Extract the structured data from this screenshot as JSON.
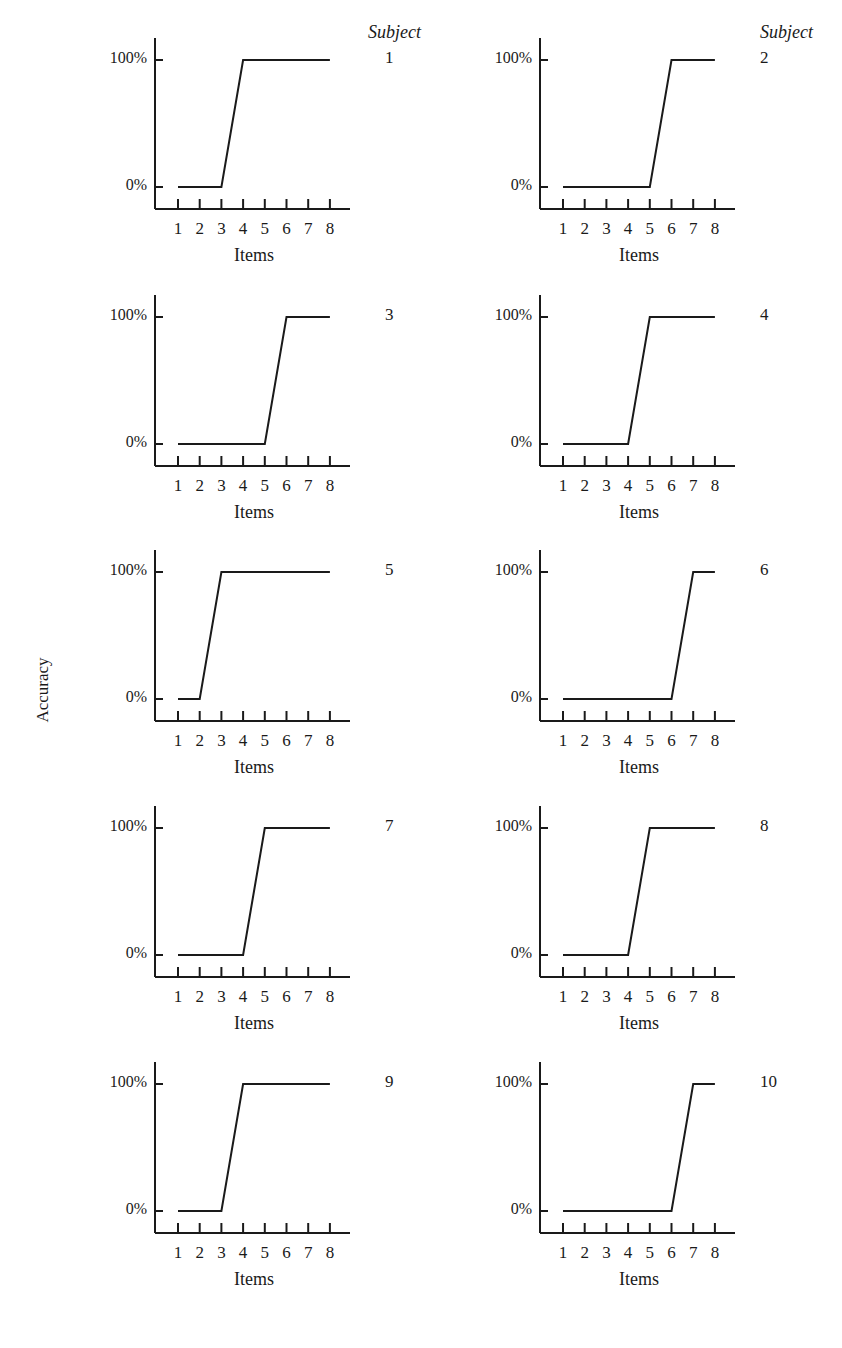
{
  "figure": {
    "y_axis_label": "Accuracy",
    "subject_header": "Subject",
    "x_axis_label": "Items",
    "y_ticks": [
      "0%",
      "100%"
    ],
    "x_ticks": [
      "1",
      "2",
      "3",
      "4",
      "5",
      "6",
      "7",
      "8"
    ]
  },
  "panels": [
    {
      "subject": "1",
      "last_zero_item": 3,
      "first_full_item": 4
    },
    {
      "subject": "2",
      "last_zero_item": 5,
      "first_full_item": 6
    },
    {
      "subject": "3",
      "last_zero_item": 5,
      "first_full_item": 6
    },
    {
      "subject": "4",
      "last_zero_item": 4,
      "first_full_item": 5
    },
    {
      "subject": "5",
      "last_zero_item": 2,
      "first_full_item": 3
    },
    {
      "subject": "6",
      "last_zero_item": 6,
      "first_full_item": 7
    },
    {
      "subject": "7",
      "last_zero_item": 4,
      "first_full_item": 5
    },
    {
      "subject": "8",
      "last_zero_item": 4,
      "first_full_item": 5
    },
    {
      "subject": "9",
      "last_zero_item": 3,
      "first_full_item": 4
    },
    {
      "subject": "10",
      "last_zero_item": 6,
      "first_full_item": 7
    }
  ],
  "chart_data": [
    {
      "type": "line",
      "title": "Subject 1",
      "xlabel": "Items",
      "ylabel": "Accuracy",
      "x": [
        1,
        2,
        3,
        4,
        5,
        6,
        7,
        8
      ],
      "values": [
        0,
        0,
        0,
        100,
        100,
        100,
        100,
        100
      ],
      "ylim": [
        0,
        100
      ],
      "y_tick_labels": [
        "0%",
        "100%"
      ],
      "grid": false
    },
    {
      "type": "line",
      "title": "Subject 2",
      "xlabel": "Items",
      "ylabel": "Accuracy",
      "x": [
        1,
        2,
        3,
        4,
        5,
        6,
        7,
        8
      ],
      "values": [
        0,
        0,
        0,
        0,
        0,
        100,
        100,
        100
      ],
      "ylim": [
        0,
        100
      ],
      "y_tick_labels": [
        "0%",
        "100%"
      ],
      "grid": false
    },
    {
      "type": "line",
      "title": "Subject 3",
      "xlabel": "Items",
      "ylabel": "Accuracy",
      "x": [
        1,
        2,
        3,
        4,
        5,
        6,
        7,
        8
      ],
      "values": [
        0,
        0,
        0,
        0,
        0,
        100,
        100,
        100
      ],
      "ylim": [
        0,
        100
      ],
      "y_tick_labels": [
        "0%",
        "100%"
      ],
      "grid": false
    },
    {
      "type": "line",
      "title": "Subject 4",
      "xlabel": "Items",
      "ylabel": "Accuracy",
      "x": [
        1,
        2,
        3,
        4,
        5,
        6,
        7,
        8
      ],
      "values": [
        0,
        0,
        0,
        0,
        100,
        100,
        100,
        100
      ],
      "ylim": [
        0,
        100
      ],
      "y_tick_labels": [
        "0%",
        "100%"
      ],
      "grid": false
    },
    {
      "type": "line",
      "title": "Subject 5",
      "xlabel": "Items",
      "ylabel": "Accuracy",
      "x": [
        1,
        2,
        3,
        4,
        5,
        6,
        7,
        8
      ],
      "values": [
        0,
        0,
        100,
        100,
        100,
        100,
        100,
        100
      ],
      "ylim": [
        0,
        100
      ],
      "y_tick_labels": [
        "0%",
        "100%"
      ],
      "grid": false
    },
    {
      "type": "line",
      "title": "Subject 6",
      "xlabel": "Items",
      "ylabel": "Accuracy",
      "x": [
        1,
        2,
        3,
        4,
        5,
        6,
        7,
        8
      ],
      "values": [
        0,
        0,
        0,
        0,
        0,
        0,
        100,
        100
      ],
      "ylim": [
        0,
        100
      ],
      "y_tick_labels": [
        "0%",
        "100%"
      ],
      "grid": false
    },
    {
      "type": "line",
      "title": "Subject 7",
      "xlabel": "Items",
      "ylabel": "Accuracy",
      "x": [
        1,
        2,
        3,
        4,
        5,
        6,
        7,
        8
      ],
      "values": [
        0,
        0,
        0,
        0,
        100,
        100,
        100,
        100
      ],
      "ylim": [
        0,
        100
      ],
      "y_tick_labels": [
        "0%",
        "100%"
      ],
      "grid": false
    },
    {
      "type": "line",
      "title": "Subject 8",
      "xlabel": "Items",
      "ylabel": "Accuracy",
      "x": [
        1,
        2,
        3,
        4,
        5,
        6,
        7,
        8
      ],
      "values": [
        0,
        0,
        0,
        0,
        100,
        100,
        100,
        100
      ],
      "ylim": [
        0,
        100
      ],
      "y_tick_labels": [
        "0%",
        "100%"
      ],
      "grid": false
    },
    {
      "type": "line",
      "title": "Subject 9",
      "xlabel": "Items",
      "ylabel": "Accuracy",
      "x": [
        1,
        2,
        3,
        4,
        5,
        6,
        7,
        8
      ],
      "values": [
        0,
        0,
        0,
        100,
        100,
        100,
        100,
        100
      ],
      "ylim": [
        0,
        100
      ],
      "y_tick_labels": [
        "0%",
        "100%"
      ],
      "grid": false
    },
    {
      "type": "line",
      "title": "Subject 10",
      "xlabel": "Items",
      "ylabel": "Accuracy",
      "x": [
        1,
        2,
        3,
        4,
        5,
        6,
        7,
        8
      ],
      "values": [
        0,
        0,
        0,
        0,
        0,
        0,
        100,
        100
      ],
      "ylim": [
        0,
        100
      ],
      "y_tick_labels": [
        "0%",
        "100%"
      ],
      "grid": false
    }
  ]
}
